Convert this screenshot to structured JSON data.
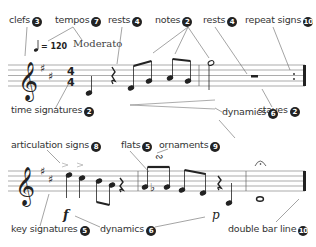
{
  "labels": {
    "clefs": {
      "text": "clefs",
      "num": "3"
    },
    "tempos": {
      "text": "tempos",
      "num": "7"
    },
    "rests_top1": {
      "text": "rests",
      "num": "4"
    },
    "notes": {
      "text": "notes",
      "num": "2"
    },
    "rests_top2": {
      "text": "rests",
      "num": "4"
    },
    "repeat_signs": {
      "text": "repeat signs",
      "num": "10"
    },
    "time_signatures": {
      "text": "time signatures",
      "num": "2"
    },
    "staves": {
      "text": "staves",
      "num": "2"
    },
    "dynamics_top": {
      "text": "dynamics",
      "num": "6"
    },
    "articulation_signs": {
      "text": "articulation signs",
      "num": "8"
    },
    "flats": {
      "text": "flats",
      "num": "5"
    },
    "ornaments": {
      "text": "ornaments",
      "num": "9"
    },
    "key_signatures": {
      "text": "key signatures",
      "num": "5"
    },
    "dynamics_bottom": {
      "text": "dynamics",
      "num": "6"
    },
    "double_bar_line": {
      "text": "double bar line",
      "num": "10"
    }
  },
  "tempo": {
    "bpm": "= 120",
    "marking": "Moderato"
  },
  "time_signature": {
    "top": "4",
    "bottom": "4"
  },
  "dynamics_marks": {
    "forte": "f",
    "piano": "p"
  }
}
